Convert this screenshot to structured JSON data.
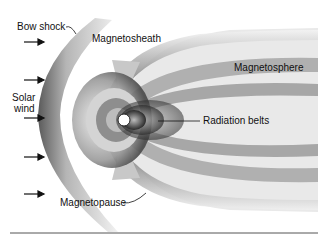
{
  "diagram": {
    "type": "magnetosphere-schematic",
    "labels": {
      "bow_shock": "Bow shock",
      "magnetosheath": "Magnetosheath",
      "magnetosphere": "Magnetosphere",
      "solar_wind_line1": "Solar",
      "solar_wind_line2": "wind",
      "radiation_belts": "Radiation belts",
      "magnetopause": "Magnetopause"
    },
    "solar_wind_arrows": 5,
    "colors": {
      "background": "#ffffff",
      "ink": "#111111",
      "shade_dark": "#3a3a3a",
      "shade_mid": "#8a8a8a",
      "shade_light": "#d8d8d8",
      "earth": "#ffffff",
      "baseline": "#555555"
    }
  }
}
